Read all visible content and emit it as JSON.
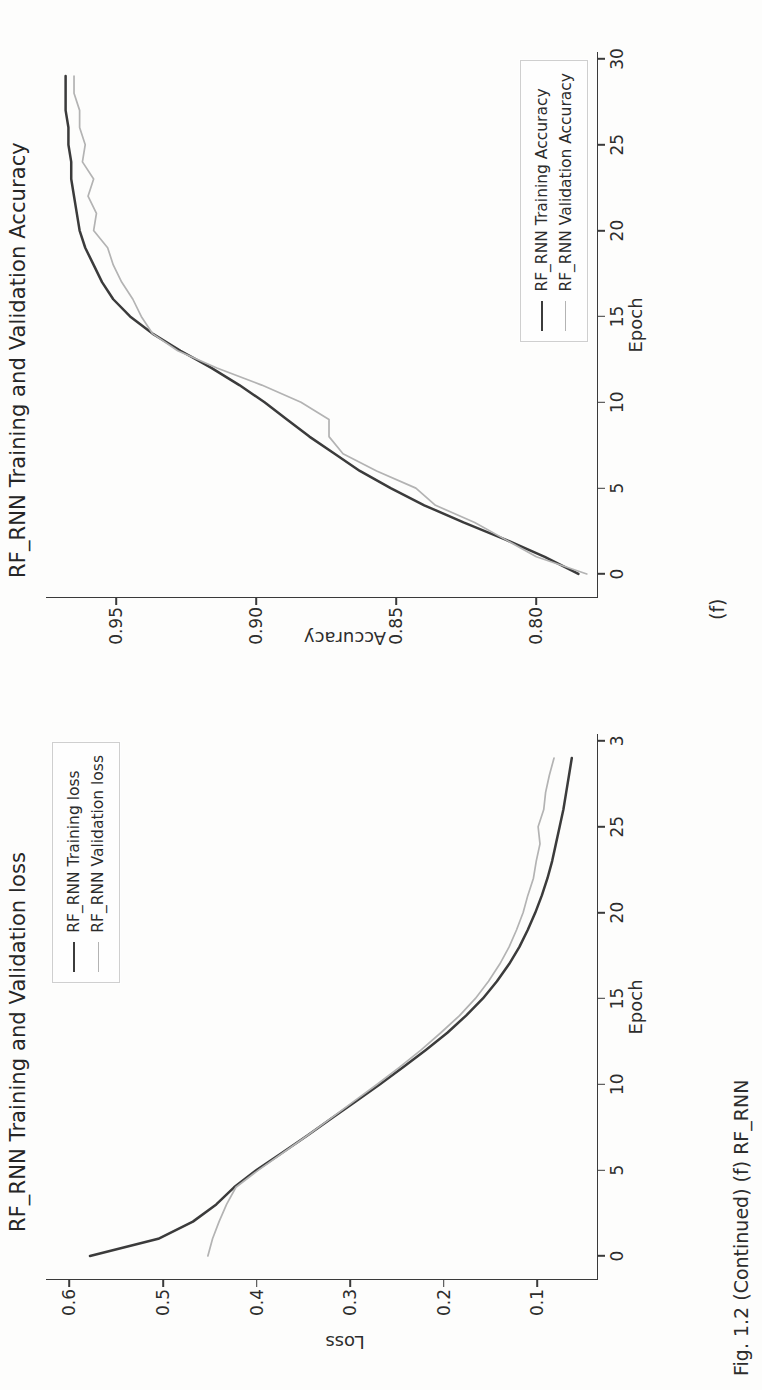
{
  "figure": {
    "subfigure_label": "(f)",
    "caption_partial": "Fig. 1.2 (Continued) (f) RF_RNN"
  },
  "colors": {
    "training": "#3b3b3b",
    "validation": "#b3b3b3",
    "axis": "#3a3a3a",
    "text": "#2d2d2d",
    "background": "#fdfdfc"
  },
  "chart_data": [
    {
      "id": "loss",
      "type": "line",
      "title": "RF_RNN Training and Validation loss",
      "xlabel": "Epoch",
      "ylabel": "Loss",
      "xlim": [
        -1.4,
        30.4
      ],
      "ylim": [
        0.035,
        0.625
      ],
      "xticks": [
        0,
        5,
        10,
        15,
        20,
        25,
        30
      ],
      "xticklabels": [
        "0",
        "5",
        "10",
        "15",
        "20",
        "25",
        "3"
      ],
      "yticks": [
        0.6,
        0.5,
        0.4,
        0.3,
        0.2,
        0.1
      ],
      "yticklabels": [
        "0.6",
        "0.5",
        "0.4",
        "0.3",
        "0.2",
        "0.1"
      ],
      "grid": false,
      "legend_position": "upper right",
      "x": [
        0,
        1,
        2,
        3,
        4,
        5,
        6,
        7,
        8,
        9,
        10,
        11,
        12,
        13,
        14,
        15,
        16,
        17,
        18,
        19,
        20,
        21,
        22,
        23,
        24,
        25,
        26,
        27,
        28,
        29
      ],
      "series": [
        {
          "name": "RF_RNN Training loss",
          "color": "#3b3b3b",
          "values": [
            0.578,
            0.505,
            0.468,
            0.443,
            0.424,
            0.4,
            0.373,
            0.346,
            0.32,
            0.294,
            0.268,
            0.243,
            0.219,
            0.196,
            0.176,
            0.158,
            0.143,
            0.13,
            0.119,
            0.11,
            0.102,
            0.095,
            0.089,
            0.084,
            0.08,
            0.076,
            0.072,
            0.069,
            0.066,
            0.063
          ]
        },
        {
          "name": "RF_RNN Validation loss",
          "color": "#b3b3b3",
          "values": [
            0.452,
            0.447,
            0.44,
            0.432,
            0.422,
            0.398,
            0.372,
            0.346,
            0.321,
            0.296,
            0.271,
            0.247,
            0.224,
            0.203,
            0.183,
            0.166,
            0.152,
            0.14,
            0.13,
            0.122,
            0.115,
            0.11,
            0.104,
            0.101,
            0.097,
            0.099,
            0.093,
            0.091,
            0.087,
            0.082
          ]
        }
      ]
    },
    {
      "id": "accuracy",
      "type": "line",
      "title": "RF_RNN Training and Validation Accuracy",
      "xlabel": "Epoch",
      "ylabel": "Accuracy",
      "xlim": [
        -1.4,
        30.4
      ],
      "ylim": [
        0.778,
        0.975
      ],
      "xticks": [
        0,
        5,
        10,
        15,
        20,
        25,
        30
      ],
      "xticklabels": [
        "0",
        "5",
        "10",
        "15",
        "20",
        "25",
        "30"
      ],
      "yticks": [
        0.95,
        0.9,
        0.85,
        0.8
      ],
      "yticklabels": [
        "0.95",
        "0.90",
        "0.85",
        "0.80"
      ],
      "grid": false,
      "legend_position": "lower right",
      "x": [
        0,
        1,
        2,
        3,
        4,
        5,
        6,
        7,
        8,
        9,
        10,
        11,
        12,
        13,
        14,
        15,
        16,
        17,
        18,
        19,
        20,
        21,
        22,
        23,
        24,
        25,
        26,
        27,
        28,
        29
      ],
      "series": [
        {
          "name": "RF_RNN Training Accuracy",
          "color": "#3b3b3b",
          "values": [
            0.785,
            0.797,
            0.811,
            0.826,
            0.84,
            0.852,
            0.863,
            0.872,
            0.881,
            0.889,
            0.897,
            0.906,
            0.916,
            0.927,
            0.937,
            0.945,
            0.951,
            0.955,
            0.958,
            0.961,
            0.963,
            0.964,
            0.965,
            0.966,
            0.966,
            0.967,
            0.967,
            0.968,
            0.968,
            0.968
          ]
        },
        {
          "name": "RF_RNN Validation Accuracy",
          "color": "#b3b3b3",
          "values": [
            0.782,
            0.8,
            0.811,
            0.822,
            0.836,
            0.843,
            0.857,
            0.869,
            0.874,
            0.874,
            0.884,
            0.898,
            0.914,
            0.928,
            0.937,
            0.941,
            0.944,
            0.948,
            0.951,
            0.953,
            0.958,
            0.957,
            0.96,
            0.958,
            0.962,
            0.961,
            0.963,
            0.963,
            0.965,
            0.965
          ]
        }
      ]
    }
  ]
}
